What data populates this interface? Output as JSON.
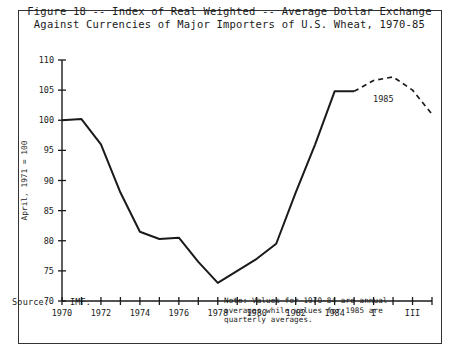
{
  "figure": {
    "title_line_1": "Figure 18 -- Index of Real Weighted -- Average Dollar Exchange",
    "title_line_2": "Against Currencies of Major Importers of U.S. Wheat, 1970-85",
    "source_label": "Source:",
    "source_value": "IMF.",
    "note_line_1": "Note:  Values for 1970-84 are annual",
    "note_line_2": "averages while values for 1985 are",
    "note_line_3": "quarterly averages.",
    "border_color": "#333333",
    "line_color": "#1a1a1a",
    "background_color": "#ffffff"
  },
  "chart_data": {
    "type": "line",
    "title": "Figure 18 -- Index of Real Weighted -- Average Dollar Exchange Against Currencies of Major Importers of U.S. Wheat, 1970-85",
    "xlabel": "",
    "ylabel": "April, 1971 = 100",
    "ylim": [
      70,
      110
    ],
    "ytick_labels": [
      "70",
      "75",
      "80",
      "85",
      "90",
      "95",
      "100",
      "105",
      "110"
    ],
    "ytick_values": [
      70,
      75,
      80,
      85,
      90,
      95,
      100,
      105,
      110
    ],
    "xtick_labels": [
      "1970",
      "",
      "1972",
      "",
      "1974",
      "",
      "1976",
      "",
      "1978",
      "",
      "1980",
      "",
      "1982",
      "",
      "1984",
      "",
      "I",
      "",
      "III",
      ""
    ],
    "xtick_positions": [
      0,
      1,
      2,
      3,
      4,
      5,
      6,
      7,
      8,
      9,
      10,
      11,
      12,
      13,
      14,
      15,
      16,
      17,
      18,
      19
    ],
    "xlim": [
      0,
      19
    ],
    "grid": false,
    "legend_position": "none",
    "annotations": [
      {
        "text": "1985",
        "x": 16.5,
        "y": 103.0
      }
    ],
    "series": [
      {
        "name": "Annual averages 1970-1984",
        "style": "solid",
        "x": [
          0,
          1,
          2,
          3,
          4,
          5,
          6,
          7,
          8,
          9,
          10,
          11,
          12,
          13,
          14,
          15
        ],
        "categories": [
          "1970",
          "1971",
          "1972",
          "1973",
          "1974",
          "1975",
          "1976",
          "1977",
          "1978",
          "1979",
          "1980",
          "1981",
          "1982",
          "1983",
          "1984",
          "1985Q1"
        ],
        "values": [
          100.0,
          100.2,
          96.0,
          88.0,
          81.5,
          80.3,
          80.5,
          76.5,
          73.0,
          75.0,
          77.0,
          79.5,
          88.0,
          96.0,
          104.8,
          104.8
        ]
      },
      {
        "name": "Quarterly averages 1985",
        "style": "dashed",
        "x": [
          15,
          16,
          17,
          18,
          19
        ],
        "categories": [
          "1985Q1",
          "1985Q2",
          "1985Q3",
          "1985Q4",
          "1985 end"
        ],
        "values": [
          104.8,
          106.6,
          107.2,
          105.0,
          101.0
        ]
      }
    ]
  }
}
